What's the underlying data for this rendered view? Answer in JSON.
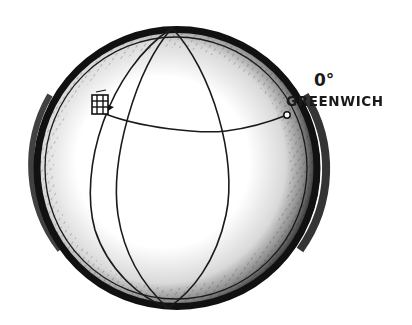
{
  "figure": {
    "style": "pen-and-ink illustration",
    "colors": {
      "ink": "#1a1a1a",
      "paper": "#ffffff"
    },
    "labels": {
      "longitude": "0°",
      "place": "GREENWICH"
    },
    "markers": [
      {
        "name": "ship",
        "icon": "ship-icon"
      },
      {
        "name": "greenwich-point",
        "icon": "circle-marker-icon"
      }
    ]
  }
}
